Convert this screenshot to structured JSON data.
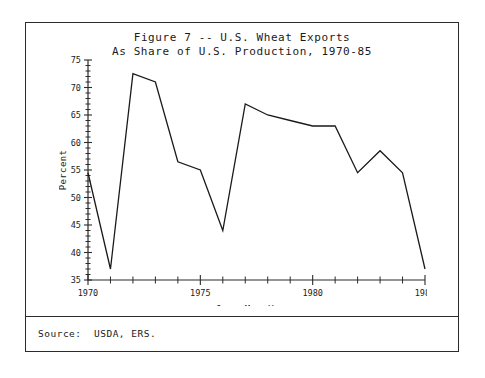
{
  "figure": {
    "title_line1": "Figure 7 -- U.S. Wheat Exports",
    "title_line2": "As Share of U.S. Production, 1970-85",
    "source_note": "Source:  USDA, ERS."
  },
  "chart_data": {
    "type": "line",
    "title": "Figure 7 -- U.S. Wheat Exports As Share of U.S. Production, 1970-85",
    "xlabel": "June-May Years",
    "ylabel": "Percent",
    "x": [
      1970,
      1971,
      1972,
      1973,
      1974,
      1975,
      1976,
      1977,
      1978,
      1979,
      1980,
      1981,
      1982,
      1983,
      1984,
      1985
    ],
    "values": [
      54.5,
      37.0,
      72.5,
      71.0,
      56.5,
      55.0,
      44.0,
      67.0,
      65.0,
      64.0,
      63.0,
      63.0,
      54.5,
      58.5,
      54.5,
      37.0
    ],
    "xlim": [
      1970,
      1985
    ],
    "ylim": [
      35,
      75
    ],
    "xticks": [
      1970,
      1971,
      1972,
      1973,
      1974,
      1975,
      1976,
      1977,
      1978,
      1979,
      1980,
      1981,
      1982,
      1983,
      1984,
      1985
    ],
    "xtick_labels": [
      "1970",
      "",
      "",
      "",
      "",
      "1975",
      "",
      "",
      "",
      "",
      "1980",
      "",
      "",
      "",
      "",
      "1985"
    ],
    "yticks": [
      35,
      40,
      45,
      50,
      55,
      60,
      65,
      70,
      75
    ],
    "ytick_labels": [
      "35",
      "40",
      "45",
      "50",
      "55",
      "60",
      "65",
      "70",
      "75"
    ],
    "yminor_step": 1,
    "grid": false,
    "legend": null,
    "series_name": "U.S. wheat exports as share of production"
  }
}
